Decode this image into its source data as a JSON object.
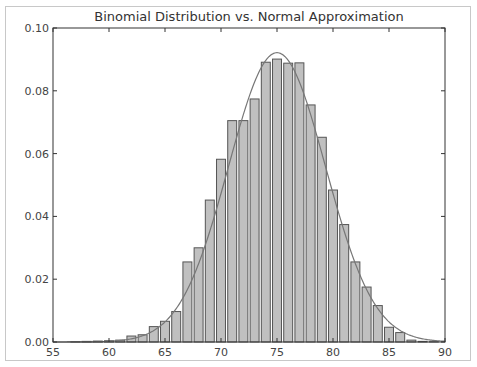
{
  "chart_data": {
    "type": "bar",
    "title": "Binomial Distribution vs. Normal Approximation",
    "xlabel": "",
    "ylabel": "",
    "xlim": [
      55,
      90
    ],
    "ylim": [
      0,
      0.1
    ],
    "xticks": [
      55,
      60,
      65,
      70,
      75,
      80,
      85,
      90
    ],
    "xtick_labels": [
      "55",
      "60",
      "65",
      "70",
      "75",
      "80",
      "85",
      "90"
    ],
    "yticks": [
      0.0,
      0.02,
      0.04,
      0.06,
      0.08,
      0.1
    ],
    "ytick_labels": [
      "0.00",
      "0.02",
      "0.04",
      "0.06",
      "0.08",
      "0.10"
    ],
    "grid": false,
    "legend": null,
    "bar_width": 0.8,
    "bar_color": "#c0c0c0",
    "bar_edge_color": "#555555",
    "line_color": "#777777",
    "series": [
      {
        "name": "Binomial (sampled)",
        "type": "bar",
        "x": [
          57,
          58,
          59,
          60,
          61,
          62,
          63,
          64,
          65,
          66,
          67,
          68,
          69,
          70,
          71,
          72,
          73,
          74,
          75,
          76,
          77,
          78,
          79,
          80,
          81,
          82,
          83,
          84,
          85,
          86,
          87,
          88,
          89
        ],
        "values": [
          0.0001,
          0.0002,
          0.0003,
          0.0004,
          0.0006,
          0.0019,
          0.0023,
          0.0049,
          0.0066,
          0.0097,
          0.0255,
          0.03,
          0.0452,
          0.0582,
          0.0705,
          0.0705,
          0.0774,
          0.0891,
          0.0901,
          0.0888,
          0.0889,
          0.0755,
          0.0652,
          0.0484,
          0.0374,
          0.0255,
          0.0175,
          0.0116,
          0.0047,
          0.003,
          0.0006,
          0.0002,
          0.0001
        ]
      },
      {
        "name": "Normal approximation",
        "type": "line",
        "mu": 75,
        "sigma": 4.33
      }
    ]
  }
}
